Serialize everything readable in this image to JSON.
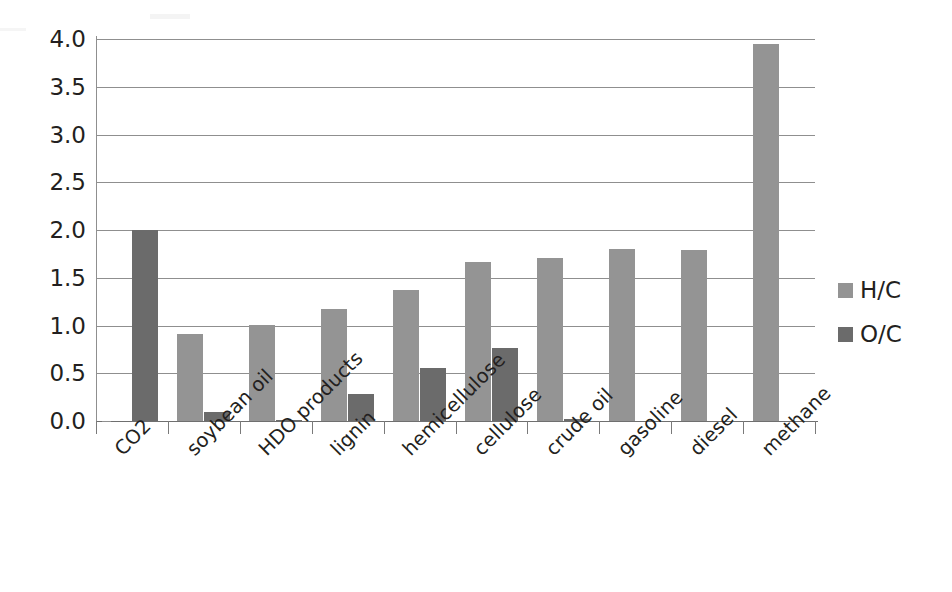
{
  "chart_data": {
    "type": "bar",
    "title": "",
    "subtitle": "",
    "xlabel": "",
    "ylabel": "",
    "categories": [
      "CO2",
      "soybean oil",
      "HDO products",
      "lignin",
      "hemicellulose",
      "cellulose",
      "crude oil",
      "gasoline",
      "diesel",
      "methane"
    ],
    "series": [
      {
        "name": "H/C",
        "color": "#949494",
        "values": [
          0,
          0.91,
          1.01,
          1.17,
          1.37,
          1.67,
          1.71,
          1.8,
          1.79,
          3.95
        ]
      },
      {
        "name": "O/C",
        "color": "#6b6b6b",
        "values": [
          2.0,
          0.09,
          0.005,
          0.28,
          0.56,
          0.76,
          0.02,
          0,
          0,
          0
        ]
      }
    ],
    "ylim": [
      0.0,
      4.0
    ],
    "ytick_values": [
      0.0,
      0.5,
      1.0,
      1.5,
      2.0,
      2.5,
      3.0,
      3.5,
      4.0
    ],
    "ytick_labels": [
      "0.0",
      "0.5",
      "1.0",
      "1.5",
      "2.0",
      "2.5",
      "3.0",
      "3.5",
      "4.0"
    ],
    "grid": true,
    "grid_axis": "y",
    "legend_position": "right",
    "xtick_label_rotation": -45
  },
  "legend": {
    "items": [
      {
        "label": "H/C",
        "color": "#949494"
      },
      {
        "label": "O/C",
        "color": "#6b6b6b"
      }
    ]
  },
  "colors": {
    "hc": "#949494",
    "oc": "#6b6b6b",
    "grid": "#8f8f8f",
    "axis": "#7a7a7a",
    "text": "#231f20",
    "background": "#ffffff"
  }
}
